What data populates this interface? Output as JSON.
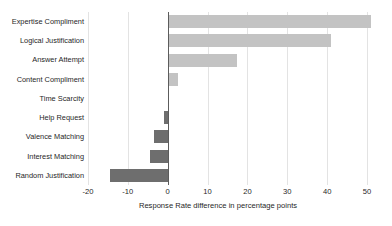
{
  "chart_data": {
    "type": "bar",
    "orientation": "horizontal",
    "title": "",
    "xlabel": "Response Rate difference in percentage points",
    "ylabel": "",
    "xlim": [
      -20,
      50
    ],
    "xticks": [
      -20,
      -10,
      0,
      10,
      20,
      30,
      40,
      50
    ],
    "xtick_labels": [
      "-20",
      "-10",
      "0",
      "10",
      "20",
      "30",
      "40",
      "50"
    ],
    "grid": true,
    "legend": "none",
    "zero_line": 0,
    "categories": [
      "Expertise Compliment",
      "Logical Justification",
      "Answer Attempt",
      "Content Compliment",
      "Time Scarcity",
      "Help Request",
      "Valence Matching",
      "Interest Matching",
      "Random Justification"
    ],
    "values": [
      51,
      41,
      17.5,
      2.5,
      0,
      -1,
      -3.5,
      -4.5,
      -14.5
    ],
    "colors": {
      "positive": "#c3c3c3",
      "negative": "#6e6e6e",
      "gridline": "#e3e3e3",
      "zero_line": "#5c5c5c",
      "text": "#1f1f1f",
      "background": "#ffffff"
    }
  }
}
